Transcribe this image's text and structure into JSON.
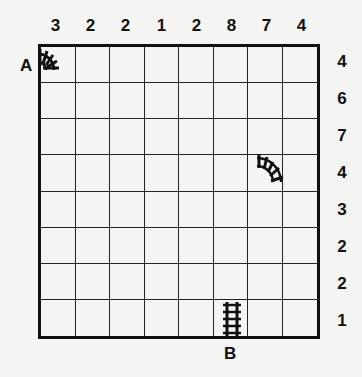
{
  "puzzle": {
    "type": "train-tracks",
    "rows": 8,
    "cols": 8,
    "column_clues": [
      "3",
      "2",
      "2",
      "1",
      "2",
      "8",
      "7",
      "4"
    ],
    "row_clues": [
      "4",
      "6",
      "7",
      "4",
      "3",
      "2",
      "2",
      "1"
    ],
    "start_label": "A",
    "end_label": "B",
    "given_pieces": [
      {
        "row": 1,
        "col": 1,
        "shape": "curve",
        "connects": "west-south",
        "label": "A"
      },
      {
        "row": 4,
        "col": 7,
        "shape": "curve",
        "connects": "west-south"
      },
      {
        "row": 8,
        "col": 6,
        "shape": "straight",
        "connects": "north-south",
        "label": "B"
      }
    ]
  }
}
